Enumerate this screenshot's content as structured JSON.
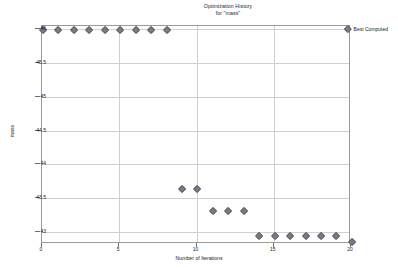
{
  "chart_data": {
    "type": "scatter",
    "title": "Optimization History",
    "subtitle": "for \"mass\"",
    "xlabel": "Number of Iterations",
    "ylabel": "mass",
    "xlim": [
      0,
      20
    ],
    "ylim": [
      42.82,
      46.05
    ],
    "xticks": [
      0,
      5,
      10,
      15,
      20
    ],
    "yticks": [
      43,
      43.5,
      44,
      44.5,
      45,
      45.5,
      46
    ],
    "ytick_labels": [
      "43",
      "43.5",
      "44",
      "44.5",
      "45",
      "45.5",
      "46"
    ],
    "xtick_labels": [
      "0",
      "5",
      "10",
      "15",
      "20"
    ],
    "grid": true,
    "legend_position": "right",
    "series": [
      {
        "name": "Best Computed",
        "marker": "diamond",
        "color": "#7b7b86",
        "x": [
          0,
          1,
          2,
          3,
          4,
          5,
          6,
          7,
          8,
          9,
          10,
          11,
          12,
          13,
          14,
          15,
          16,
          17,
          18,
          19,
          20
        ],
        "values": [
          46.0,
          46.0,
          46.0,
          46.0,
          46.0,
          46.0,
          46.0,
          46.0,
          46.0,
          43.65,
          43.65,
          43.32,
          43.32,
          43.32,
          42.95,
          42.95,
          42.95,
          42.95,
          42.95,
          42.95,
          42.87
        ]
      }
    ]
  },
  "legend": {
    "entries": [
      {
        "label": "Best Computed"
      }
    ]
  }
}
